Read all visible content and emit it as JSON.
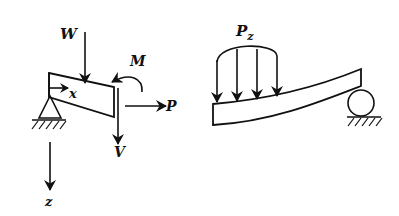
{
  "diagram": {
    "stroke_color": "#111111",
    "background": "#ffffff",
    "left_figure": {
      "description": "beam segment with free-body loads on pinned support",
      "labels": {
        "weight": "W",
        "moment": "M",
        "axial_force": "P",
        "shear_force": "V",
        "x_axis": "x",
        "z_axis": "z"
      }
    },
    "right_figure": {
      "description": "deflected beam under distributed load with roller support",
      "labels": {
        "distributed_load": "P",
        "distributed_load_subscript": "z"
      },
      "arrow_count": 4
    }
  }
}
